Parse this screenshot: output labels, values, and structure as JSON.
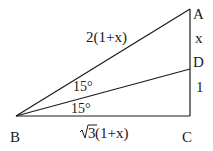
{
  "diagram": {
    "type": "right-triangle",
    "points": {
      "A": {
        "label": "A",
        "x": 190,
        "y": 9
      },
      "B": {
        "label": "B",
        "x": 16,
        "y": 116
      },
      "C": {
        "label": "C",
        "x": 190,
        "y": 116
      },
      "D": {
        "label": "D",
        "x": 190,
        "y": 69
      }
    },
    "segments": {
      "AB": "2(1+x)",
      "AD": "x",
      "DC": "1",
      "BC_root": "3",
      "BC_rest": " (1+x)"
    },
    "angles": {
      "ABD": "15°",
      "DBC": "15°"
    },
    "stroke_color": "#1a1a1a"
  }
}
